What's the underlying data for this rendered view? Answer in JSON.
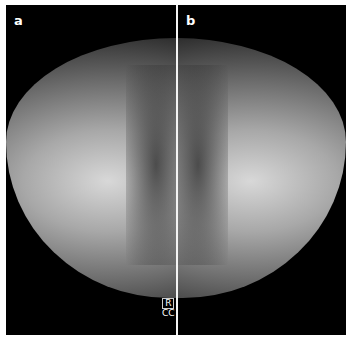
{
  "panels": [
    {
      "label": "a"
    },
    {
      "label": "b"
    }
  ],
  "marker": {
    "side": "R",
    "view": "CC"
  },
  "colors": {
    "background": "#000000",
    "divider": "#f4f4f4",
    "label": "#ffffff"
  }
}
